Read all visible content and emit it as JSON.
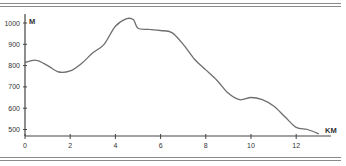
{
  "chart_data": {
    "type": "line",
    "title": "",
    "xlabel": "KM",
    "ylabel": "M",
    "xlim": [
      0,
      13.5
    ],
    "ylim": [
      470,
      1030
    ],
    "x_ticks": [
      0,
      2,
      4,
      6,
      8,
      10,
      12
    ],
    "y_ticks": [
      500,
      600,
      700,
      800,
      900,
      1000
    ],
    "grid": false,
    "legend": null,
    "series": [
      {
        "name": "Elevation profile",
        "color": "#6e6e6e",
        "x": [
          0,
          0.5,
          1,
          1.5,
          2,
          2.5,
          3,
          3.5,
          4,
          4.5,
          4.8,
          5,
          5.5,
          6,
          6.5,
          7,
          7.5,
          8,
          8.5,
          9,
          9.5,
          10,
          10.5,
          11,
          11.5,
          12,
          12.5,
          13
        ],
        "y": [
          815,
          825,
          800,
          770,
          775,
          810,
          860,
          900,
          985,
          1020,
          1015,
          975,
          970,
          965,
          955,
          900,
          830,
          780,
          730,
          670,
          640,
          650,
          640,
          610,
          560,
          510,
          500,
          480
        ]
      }
    ]
  },
  "labels": {
    "y_unit": "M",
    "x_unit": "KM",
    "y_ticks": [
      "500",
      "600",
      "700",
      "800",
      "900",
      "1000"
    ],
    "x_ticks": [
      "0",
      "2",
      "4",
      "6",
      "8",
      "10",
      "12"
    ]
  }
}
